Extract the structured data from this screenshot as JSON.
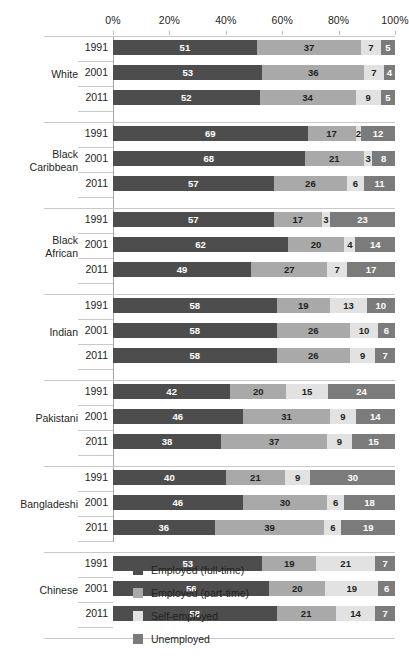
{
  "chart_data": {
    "type": "bar",
    "orientation": "horizontal",
    "stacked": true,
    "normalized": true,
    "title": "",
    "subtitle": "",
    "xlabel": "",
    "ylabel": "",
    "xlim": [
      0,
      100
    ],
    "grid": false,
    "legend_position": "bottom",
    "axis_ticks": [
      "0%",
      "20%",
      "40%",
      "60%",
      "80%",
      "100%"
    ],
    "axis_tick_values": [
      0,
      20,
      40,
      60,
      80,
      100
    ],
    "series": [
      {
        "name": "Employed (full-time)",
        "color": "#4d4d4d"
      },
      {
        "name": "Employed (part-time)",
        "color": "#a9a9a9"
      },
      {
        "name": "Self-employed",
        "color": "#e2e2e2"
      },
      {
        "name": "Unemployed",
        "color": "#7b7b7b"
      }
    ],
    "groups": [
      {
        "label": "White",
        "rows": [
          {
            "year": "1991",
            "values": [
              51,
              37,
              7,
              5
            ]
          },
          {
            "year": "2001",
            "values": [
              53,
              36,
              7,
              4
            ]
          },
          {
            "year": "2011",
            "values": [
              52,
              34,
              9,
              5
            ]
          }
        ]
      },
      {
        "label": "Black\nCaribbean",
        "rows": [
          {
            "year": "1991",
            "values": [
              69,
              17,
              2,
              12
            ]
          },
          {
            "year": "2001",
            "values": [
              68,
              21,
              3,
              8
            ]
          },
          {
            "year": "2011",
            "values": [
              57,
              26,
              6,
              11
            ]
          }
        ]
      },
      {
        "label": "Black\nAfrican",
        "rows": [
          {
            "year": "1991",
            "values": [
              57,
              17,
              3,
              23
            ]
          },
          {
            "year": "2001",
            "values": [
              62,
              20,
              4,
              14
            ]
          },
          {
            "year": "2011",
            "values": [
              49,
              27,
              7,
              17
            ]
          }
        ]
      },
      {
        "label": "Indian",
        "rows": [
          {
            "year": "1991",
            "values": [
              58,
              19,
              13,
              10
            ]
          },
          {
            "year": "2001",
            "values": [
              58,
              26,
              10,
              6
            ]
          },
          {
            "year": "2011",
            "values": [
              58,
              26,
              9,
              7
            ]
          }
        ]
      },
      {
        "label": "Pakistani",
        "rows": [
          {
            "year": "1991",
            "values": [
              42,
              20,
              15,
              24
            ]
          },
          {
            "year": "2001",
            "values": [
              46,
              31,
              9,
              14
            ]
          },
          {
            "year": "2011",
            "values": [
              38,
              37,
              9,
              15
            ]
          }
        ]
      },
      {
        "label": "Bangladeshi",
        "rows": [
          {
            "year": "1991",
            "values": [
              40,
              21,
              9,
              30
            ]
          },
          {
            "year": "2001",
            "values": [
              46,
              30,
              6,
              18
            ]
          },
          {
            "year": "2011",
            "values": [
              36,
              39,
              6,
              19
            ]
          }
        ]
      },
      {
        "label": "Chinese",
        "rows": [
          {
            "year": "1991",
            "values": [
              53,
              19,
              21,
              7
            ]
          },
          {
            "year": "2001",
            "values": [
              56,
              20,
              19,
              6
            ]
          },
          {
            "year": "2011",
            "values": [
              58,
              21,
              14,
              7
            ]
          }
        ]
      }
    ]
  }
}
